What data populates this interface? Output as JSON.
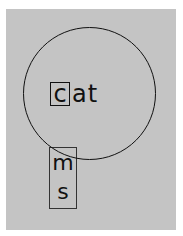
{
  "scene": {
    "background_color": "#c4c4c4",
    "word": {
      "boxed_letter": "c",
      "rest": "at"
    },
    "letter_tile": {
      "letters": [
        "m",
        "s"
      ]
    }
  }
}
